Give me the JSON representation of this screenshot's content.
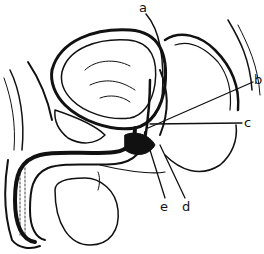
{
  "diagram": {
    "type": "anatomical-sagittal-section",
    "style": "black-and-white line drawing",
    "labels": [
      {
        "id": "a",
        "text": "a",
        "x": 139,
        "y": 1
      },
      {
        "id": "b",
        "text": "b",
        "x": 254,
        "y": 73
      },
      {
        "id": "c",
        "text": "c",
        "x": 244,
        "y": 116
      },
      {
        "id": "e",
        "text": "e",
        "x": 160,
        "y": 200
      },
      {
        "id": "d",
        "text": "d",
        "x": 182,
        "y": 200
      }
    ]
  }
}
